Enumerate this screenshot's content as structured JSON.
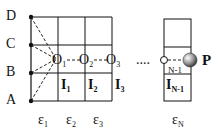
{
  "diagram": {
    "left_points": [
      {
        "label": "D"
      },
      {
        "label": "C"
      },
      {
        "label": "B"
      },
      {
        "label": "A"
      }
    ],
    "nodes": [
      {
        "label": "O",
        "sub": "1"
      },
      {
        "label": "O",
        "sub": "2"
      },
      {
        "label": "O",
        "sub": "3"
      },
      {
        "label": "",
        "sub": "N-1"
      }
    ],
    "cells": [
      {
        "label": "I",
        "sub": "1"
      },
      {
        "label": "I",
        "sub": "2"
      },
      {
        "label": "I",
        "sub": "3"
      },
      {
        "label": "I",
        "sub": "N-1"
      }
    ],
    "columns": [
      {
        "label": "ε",
        "sub": "1"
      },
      {
        "label": "ε",
        "sub": "2"
      },
      {
        "label": "ε",
        "sub": "3"
      },
      {
        "label": "ε",
        "sub": "N"
      }
    ],
    "ellipsis": "....",
    "particle": {
      "label": "P"
    }
  }
}
